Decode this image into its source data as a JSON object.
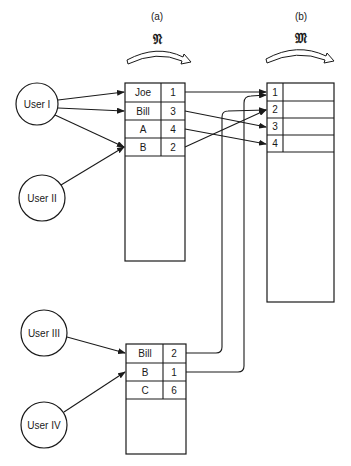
{
  "diagram": {
    "type": "name-mapping-diagram",
    "mappings": [
      {
        "id": "a",
        "label": "(a)",
        "symbol": "𝔑"
      },
      {
        "id": "b",
        "label": "(b)",
        "symbol": "𝔐"
      }
    ],
    "users": [
      {
        "id": "user1",
        "label": "User I"
      },
      {
        "id": "user2",
        "label": "User II"
      },
      {
        "id": "user3",
        "label": "User III"
      },
      {
        "id": "user4",
        "label": "User IV"
      }
    ],
    "name_table_upper": {
      "rows": [
        {
          "name": "Joe",
          "index": "1"
        },
        {
          "name": "Bill",
          "index": "3"
        },
        {
          "name": "A",
          "index": "4"
        },
        {
          "name": "B",
          "index": "2"
        }
      ]
    },
    "name_table_lower": {
      "rows": [
        {
          "name": "Bill",
          "index": "2"
        },
        {
          "name": "B",
          "index": "1"
        },
        {
          "name": "C",
          "index": "6"
        }
      ]
    },
    "object_table": {
      "rows": [
        {
          "index": "1"
        },
        {
          "index": "2"
        },
        {
          "index": "3"
        },
        {
          "index": "4"
        }
      ]
    },
    "edges": [
      {
        "from": "User I",
        "to": "Joe"
      },
      {
        "from": "User I",
        "to": "Bill"
      },
      {
        "from": "User I",
        "to": "B"
      },
      {
        "from": "User II",
        "to": "B"
      },
      {
        "from": "User III",
        "to": "Bill (lower)"
      },
      {
        "from": "User IV",
        "to": "B (lower)"
      },
      {
        "from": "Joe 1",
        "to": "object 1"
      },
      {
        "from": "Bill 3",
        "to": "object 3"
      },
      {
        "from": "A 4",
        "to": "object 4"
      },
      {
        "from": "B 2",
        "to": "object 2"
      },
      {
        "from": "Bill 2 (lower)",
        "to": "object 2"
      },
      {
        "from": "B 1 (lower)",
        "to": "object 1"
      }
    ]
  }
}
